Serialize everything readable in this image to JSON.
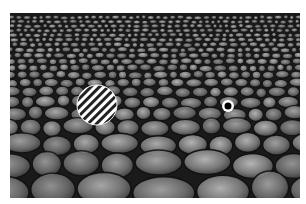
{
  "scene": {
    "description": "Cobblestone texture field receding in perspective with a striped disk and a ring target",
    "frame": {
      "x": 10,
      "y": 13,
      "width": 290,
      "height": 185
    },
    "background_color": "#1a1a1a",
    "stone_colors": [
      "#5a5a5a",
      "#6e6e6e",
      "#7d7d7d",
      "#8c8c8c",
      "#9a9a9a"
    ],
    "striped_disk": {
      "cx": 87,
      "cy": 92,
      "r": 20,
      "stripe_angle_deg": 45,
      "stripe_color": "#222222",
      "fill": "#ffffff"
    },
    "ring_target": {
      "cx": 218,
      "cy": 93,
      "outer_r": 6,
      "inner_r": 3.5,
      "ring_color": "#ffffff",
      "center_color": "#000000"
    }
  }
}
